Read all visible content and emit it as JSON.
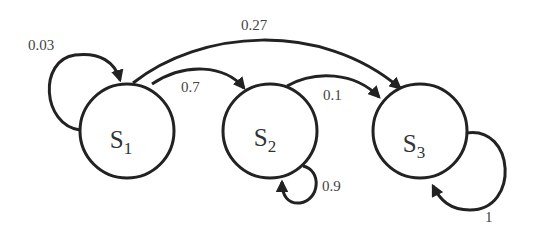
{
  "diagram": {
    "type": "markov-chain-state-diagram",
    "states": [
      {
        "id": "S1",
        "label": "S",
        "subscript": "1"
      },
      {
        "id": "S2",
        "label": "S",
        "subscript": "2"
      },
      {
        "id": "S3",
        "label": "S",
        "subscript": "3"
      }
    ],
    "transitions": [
      {
        "from": "S1",
        "to": "S1",
        "label": "0.03"
      },
      {
        "from": "S1",
        "to": "S2",
        "label": "0.7"
      },
      {
        "from": "S1",
        "to": "S3",
        "label": "0.27"
      },
      {
        "from": "S2",
        "to": "S2",
        "label": "0.9"
      },
      {
        "from": "S2",
        "to": "S3",
        "label": "0.1"
      },
      {
        "from": "S3",
        "to": "S3",
        "label": "1"
      }
    ],
    "colors": {
      "stroke": "#222222",
      "text": "#444444",
      "background": "#ffffff"
    }
  }
}
